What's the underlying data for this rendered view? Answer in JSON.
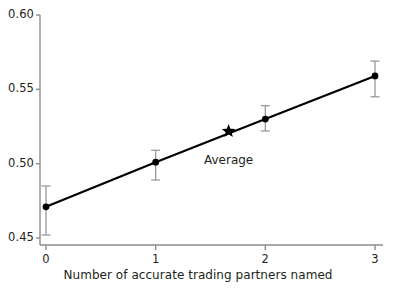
{
  "chart_data": {
    "type": "line",
    "title": "",
    "subtitle": "",
    "xlabel": "Number of accurate trading partners named",
    "ylabel": "",
    "x": [
      0,
      1,
      2,
      3
    ],
    "xtick_labels": [
      "0",
      "1",
      "2",
      "3"
    ],
    "ytick_labels": [
      "0.45",
      "0.50",
      "0.55",
      "0.60"
    ],
    "ytick_values": [
      0.45,
      0.5,
      0.55,
      0.6
    ],
    "xlim": [
      -0.12,
      3.12
    ],
    "ylim": [
      0.45,
      0.6
    ],
    "grid": false,
    "legend": false,
    "legend_position": "none",
    "series": [
      {
        "name": "Estimate",
        "marker": "filled-circle",
        "line_color": "#000000",
        "values": [
          0.471,
          0.501,
          0.53,
          0.559
        ],
        "error_low": [
          0.452,
          0.489,
          0.522,
          0.545
        ],
        "error_high": [
          0.485,
          0.509,
          0.539,
          0.569
        ]
      }
    ],
    "annotations": [
      {
        "name": "average-marker",
        "label": "Average",
        "marker": "star",
        "x": 1.665,
        "y": 0.5218,
        "label_offset_px": 22
      }
    ],
    "axis_color": "#8c8c8c",
    "data_color": "#000000",
    "text_color": "#231f20",
    "background": "#ffffff"
  }
}
